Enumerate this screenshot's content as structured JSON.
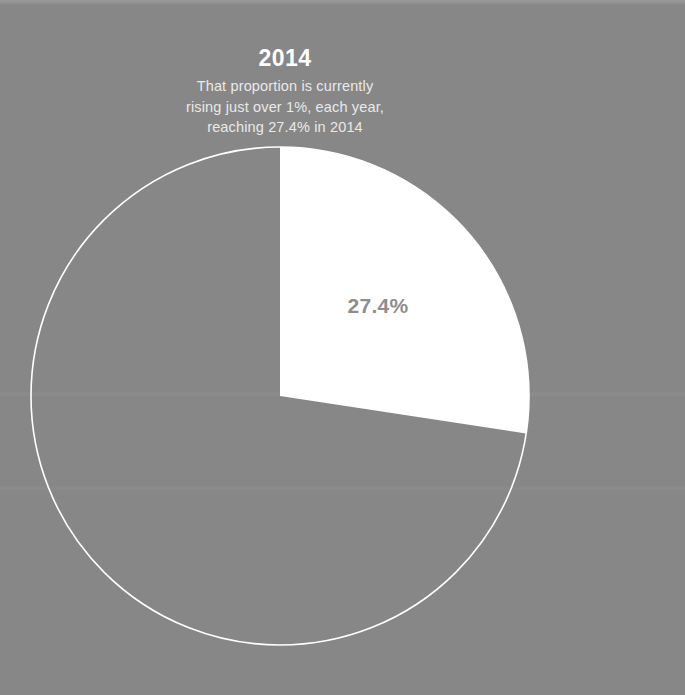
{
  "theme": {
    "background_color": "#878787",
    "slice_color": "#ffffff",
    "outline_color": "#ffffff",
    "title_color": "#ffffff",
    "subtitle_color": "#e9e9e9",
    "label_color": "#8e8e8e"
  },
  "header": {
    "title": "2014",
    "subtitle_lines": [
      "That proportion is currently",
      "rising just over 1%, each year,",
      "reaching 27.4% in 2014"
    ]
  },
  "chart_data": {
    "type": "pie",
    "title": "2014",
    "subtitle": "That proportion is currently rising just over 1%, each year, reaching 27.4% in 2014",
    "categories": [
      "Share",
      "Remainder"
    ],
    "values": [
      27.4,
      72.6
    ],
    "labels": [
      "27.4%",
      ""
    ],
    "units": "%",
    "start_angle_deg": 0,
    "direction": "clockwise",
    "legend": "none",
    "grid": false,
    "slice_colors": [
      "#ffffff",
      "none"
    ],
    "outline_only_slices": [
      "Remainder"
    ],
    "geometry": {
      "center_x": 280,
      "center_y": 396,
      "radius": 249,
      "sweep_deg": 98.6
    },
    "annotations": [
      {
        "text": "27.4%",
        "x": 378,
        "y": 308
      }
    ]
  }
}
